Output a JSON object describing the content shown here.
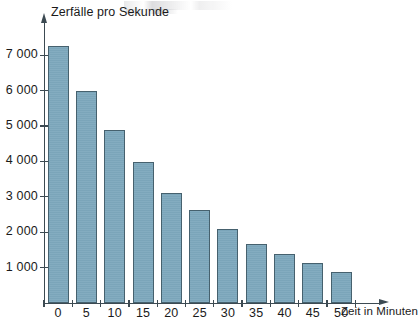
{
  "chart_data": {
    "type": "bar",
    "title": "",
    "xlabel": "Zeit in Minuten",
    "ylabel": "Zerfälle pro Sekunde",
    "categories": [
      "0",
      "5",
      "10",
      "15",
      "20",
      "25",
      "30",
      "35",
      "40",
      "45",
      "50"
    ],
    "x": [
      0,
      5,
      10,
      15,
      20,
      25,
      30,
      35,
      40,
      45,
      50
    ],
    "values": [
      7250,
      6000,
      4880,
      3980,
      3120,
      2620,
      2080,
      1680,
      1390,
      1130,
      880
    ],
    "xlim": [
      -2.5,
      52.5
    ],
    "ylim": [
      0,
      7600
    ],
    "ytick_values": [
      1000,
      2000,
      3000,
      4000,
      5000,
      6000,
      7000
    ],
    "ytick_labels": [
      "1 000",
      "2 000",
      "3 000",
      "4 000",
      "5 000",
      "6 000",
      "7 000"
    ],
    "xtick_labels": [
      "0",
      "5",
      "10",
      "15",
      "20",
      "25",
      "30",
      "35",
      "40",
      "45",
      "50"
    ],
    "grid": false,
    "legend": null,
    "bar_color": "#7da8bd",
    "bar_edge_color": "#46616e",
    "axis_color": "#3c4a52"
  }
}
